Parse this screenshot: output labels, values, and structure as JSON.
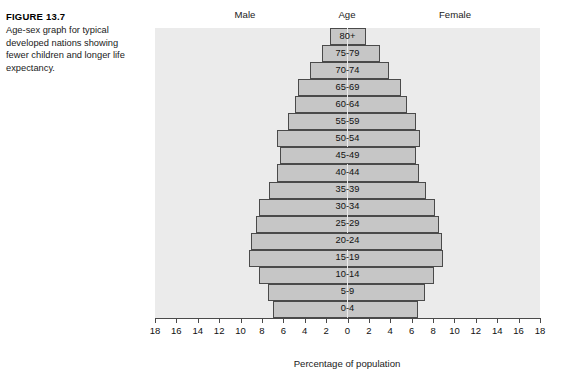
{
  "figure": {
    "label": "FIGURE 13.7",
    "caption": "Age-sex graph for typical developed nations showing fewer children and longer life expectancy."
  },
  "chart_data": {
    "type": "bar",
    "orientation": "horizontal-diverging",
    "title": "",
    "header_male": "Male",
    "header_age": "Age",
    "header_female": "Female",
    "xlabel": "Percentage of population",
    "ylabel": "Age",
    "xlim": [
      -18,
      18
    ],
    "xticks": [
      "18",
      "16",
      "14",
      "12",
      "10",
      "8",
      "6",
      "4",
      "2",
      "0",
      "2",
      "4",
      "6",
      "8",
      "10",
      "12",
      "14",
      "16",
      "18"
    ],
    "xtick_values": [
      -18,
      -16,
      -14,
      -12,
      -10,
      -8,
      -6,
      -4,
      -2,
      0,
      2,
      4,
      6,
      8,
      10,
      12,
      14,
      16,
      18
    ],
    "grid": false,
    "legend": "none",
    "categories": [
      "80+",
      "75-79",
      "70-74",
      "65-69",
      "60-64",
      "55-59",
      "50-54",
      "45-49",
      "40-44",
      "35-39",
      "30-34",
      "25-29",
      "20-24",
      "15-19",
      "10-14",
      "5-9",
      "0-4"
    ],
    "series": [
      {
        "name": "Male",
        "side": "left",
        "values": [
          1.6,
          2.4,
          3.5,
          4.6,
          4.9,
          5.6,
          6.6,
          6.3,
          6.6,
          7.3,
          8.3,
          8.6,
          9.0,
          9.2,
          8.3,
          7.4,
          7.0
        ]
      },
      {
        "name": "Female",
        "side": "right",
        "values": [
          1.7,
          3.0,
          3.9,
          5.0,
          5.6,
          6.4,
          6.8,
          6.4,
          6.7,
          7.3,
          8.2,
          8.6,
          8.8,
          8.9,
          8.1,
          7.2,
          6.6
        ]
      }
    ],
    "colors": {
      "bar_fill": "#c6c6c6",
      "bar_stroke": "#4a4a4a",
      "plot_background": "#ebebeb",
      "page_background": "#ffffff",
      "text": "#111111"
    }
  }
}
